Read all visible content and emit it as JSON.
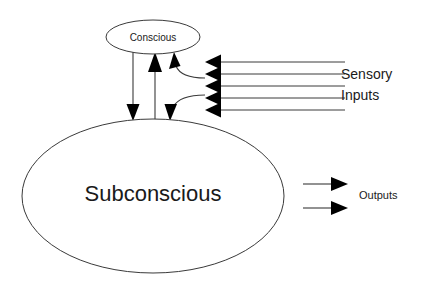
{
  "diagram": {
    "type": "block-flow-diagram",
    "background_color": "#ffffff",
    "line_color": "#3a3a3a",
    "arrow_color": "#000000",
    "text_color": "#1a1a1a",
    "nodes": [
      {
        "id": "conscious",
        "label": "Conscious",
        "shape": "ellipse",
        "cx": 153,
        "cy": 37,
        "rx": 47,
        "ry": 17
      },
      {
        "id": "subconscious",
        "label": "Subconscious",
        "shape": "ellipse",
        "cx": 153,
        "cy": 196,
        "rx": 131,
        "ry": 77
      }
    ],
    "labels": {
      "sensory_line_1": "Sensory",
      "sensory_line_2": "Inputs",
      "outputs": "Outputs"
    },
    "edges": [
      {
        "id": "conscious-to-subconscious",
        "from": "conscious",
        "to": "subconscious",
        "direction": "down"
      },
      {
        "id": "subconscious-to-conscious",
        "from": "subconscious",
        "to": "conscious",
        "direction": "up"
      },
      {
        "id": "sensory-to-conscious",
        "from": "sensory-inputs",
        "to": "conscious",
        "direction": "curved-up-left"
      },
      {
        "id": "sensory-to-subconscious",
        "from": "sensory-inputs",
        "to": "subconscious",
        "direction": "curved-down-left"
      }
    ],
    "sensory_inputs": {
      "count": 5,
      "label": "Sensory Inputs",
      "arrow_tip_x": 205,
      "line_end_x": 345,
      "rows_y": [
        62,
        74,
        86,
        98,
        110
      ]
    },
    "outputs": {
      "count": 2,
      "label": "Outputs",
      "line_start_x": 303,
      "arrow_tip_x": 347,
      "rows_y": [
        184,
        208
      ]
    }
  }
}
